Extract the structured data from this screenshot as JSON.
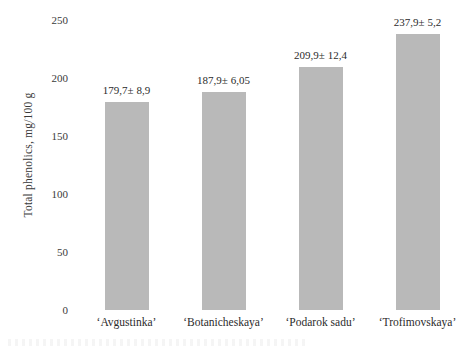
{
  "chart_data": {
    "type": "bar",
    "title": "",
    "xlabel": "",
    "ylabel": "Total phenolics, mg/100 g",
    "categories": [
      "‘Avgustinka’",
      "‘Botanicheskaya’",
      "‘Podarok sadu’",
      "‘Trofimovskaya’"
    ],
    "values": [
      179.7,
      187.9,
      209.9,
      237.9
    ],
    "errors": [
      8.9,
      6.05,
      12.4,
      5.2
    ],
    "data_labels": [
      "179,7± 8,9",
      "187,9± 6,05",
      "209,9± 12,4",
      "237,9± 5,2"
    ],
    "ylim": [
      0,
      250
    ],
    "yticks": [
      250,
      200,
      150,
      100,
      50,
      0
    ],
    "ytick_labels": [
      "250",
      "200",
      "150",
      "100",
      "50",
      "0"
    ],
    "grid": false,
    "legend": false,
    "bar_color": "#b9b9b9",
    "background_color": "#ffffff",
    "text_color": "#2b2b2b"
  }
}
